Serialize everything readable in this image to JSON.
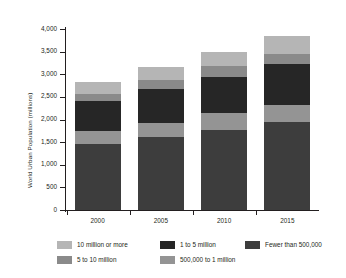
{
  "chart_data": {
    "type": "bar",
    "subtype": "stacked-vertical",
    "title": "",
    "xlabel": "",
    "ylabel": "World Urban Population (millions)",
    "categories": [
      "2000",
      "2005",
      "2010",
      "2015"
    ],
    "ylim": [
      0,
      4000
    ],
    "ytick_labels": [
      "0",
      "500",
      "1,000",
      "1,500",
      "2,000",
      "2,500",
      "3,000",
      "3,500",
      "4,000"
    ],
    "ytick_values": [
      0,
      500,
      1000,
      1500,
      2000,
      2500,
      3000,
      3500,
      4000
    ],
    "grid": false,
    "legend_position": "bottom",
    "stack_order_bottom_to_top": [
      "Fewer than 500,000",
      "500,000 to 1 million",
      "1 to 5 million",
      "5 to 10 million",
      "10 million or more"
    ],
    "series": [
      {
        "name": "Fewer than 500,000",
        "color": "#3d3d3d",
        "values": [
          1450,
          1610,
          1775,
          1940
        ]
      },
      {
        "name": "500,000 to 1 million",
        "color": "#949494",
        "values": [
          300,
          320,
          365,
          370
        ]
      },
      {
        "name": "1 to 5 million",
        "color": "#262626",
        "values": [
          660,
          740,
          800,
          910
        ]
      },
      {
        "name": "5 to 10 million",
        "color": "#8a8a8a",
        "values": [
          150,
          210,
          240,
          230
        ]
      },
      {
        "name": "10 million or more",
        "color": "#b5b5b5",
        "values": [
          270,
          280,
          310,
          390
        ]
      }
    ],
    "totals": [
      2830,
      3160,
      3490,
      3840
    ],
    "cumulative_tops": [
      [
        1450,
        1750,
        2410,
        2560,
        2830
      ],
      [
        1610,
        1930,
        2670,
        2880,
        3160
      ],
      [
        1775,
        2140,
        2940,
        3180,
        3490
      ],
      [
        1940,
        2310,
        3220,
        3450,
        3840
      ]
    ]
  },
  "legend": {
    "items": [
      {
        "label": "10 million or more",
        "color": "#b5b5b5",
        "row": 0,
        "col": 0
      },
      {
        "label": "1 to 5 million",
        "color": "#262626",
        "row": 0,
        "col": 1
      },
      {
        "label": "Fewer than 500,000",
        "color": "#3d3d3d",
        "row": 0,
        "col": 2
      },
      {
        "label": "5 to 10 million",
        "color": "#8a8a8a",
        "row": 1,
        "col": 0
      },
      {
        "label": "500,000 to 1 million",
        "color": "#949494",
        "row": 1,
        "col": 1
      }
    ]
  },
  "axis": {
    "color": "#231f20",
    "background": "#ffffff"
  }
}
